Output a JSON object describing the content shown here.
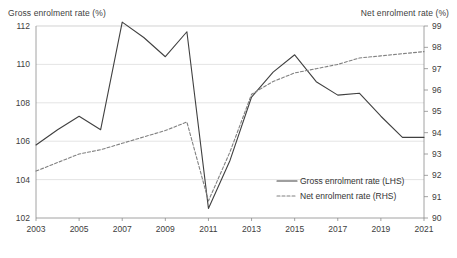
{
  "chart_data": {
    "type": "line",
    "title": "",
    "xlabel": "",
    "ylabel": "Gross enrolment rate (%)",
    "y2label": "Net enrolment rate (%)",
    "grid": true,
    "legend_position": "inside-bottom-right",
    "x": [
      2003,
      2004,
      2005,
      2006,
      2007,
      2008,
      2009,
      2010,
      2011,
      2012,
      2013,
      2014,
      2015,
      2016,
      2017,
      2018,
      2019,
      2020,
      2021
    ],
    "xticks": [
      2003,
      2005,
      2007,
      2009,
      2011,
      2013,
      2015,
      2017,
      2019,
      2021
    ],
    "xlim": [
      2003,
      2021
    ],
    "ylim": [
      102,
      112
    ],
    "yticks": [
      102,
      104,
      106,
      108,
      110,
      112
    ],
    "y2lim": [
      90,
      99
    ],
    "y2ticks": [
      90,
      91,
      92,
      93,
      94,
      95,
      96,
      97,
      98,
      99
    ],
    "series": [
      {
        "name": "Gross enrolment rate (LHS)",
        "axis": "left",
        "style": "solid",
        "color": "#404040",
        "values": [
          105.8,
          106.6,
          107.3,
          106.6,
          112.2,
          111.4,
          110.4,
          111.7,
          102.5,
          105.0,
          108.3,
          109.6,
          110.5,
          109.1,
          108.4,
          108.5,
          107.3,
          106.2,
          106.2
        ]
      },
      {
        "name": "Net enrolment rate (RHS)",
        "axis": "right",
        "style": "dashed",
        "color": "#808080",
        "values": [
          92.2,
          92.6,
          93.0,
          93.2,
          93.5,
          93.8,
          94.1,
          94.5,
          90.8,
          93.1,
          95.8,
          96.4,
          96.8,
          97.0,
          97.2,
          97.5,
          97.6,
          97.7,
          97.8
        ]
      }
    ],
    "legend": [
      {
        "label": "Gross enrolment rate (LHS)",
        "style": "solid",
        "color": "#404040"
      },
      {
        "label": "Net enrolment rate (RHS)",
        "style": "dashed",
        "color": "#808080"
      }
    ]
  },
  "colors": {
    "gridline": "#d9d9d9",
    "axis": "#8c8c8c",
    "text": "#404040",
    "background": "#ffffff"
  }
}
